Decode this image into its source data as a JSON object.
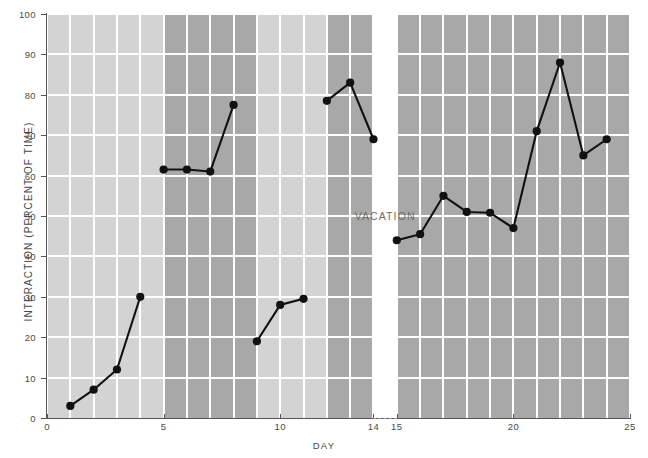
{
  "chart_data": {
    "type": "line",
    "title": "",
    "xlabel": "DAY",
    "ylabel": "INTERACTION (PERCENT OF TIME)",
    "xlim": [
      0,
      25
    ],
    "ylim": [
      0,
      100
    ],
    "grid": true,
    "legend": null,
    "y_ticks": [
      0,
      10,
      20,
      30,
      40,
      50,
      60,
      70,
      80,
      90,
      100
    ],
    "x_ticks": [
      0,
      5,
      10,
      14,
      15,
      20,
      25
    ],
    "x_tick_labels": [
      "0",
      "5",
      "10",
      "14",
      "15",
      "20",
      "25"
    ],
    "annotations": [
      {
        "text": "VACATION",
        "x": 14.5,
        "y": 50
      }
    ],
    "series": [
      {
        "name": "Interaction",
        "marker": "filled-circle",
        "color": "#111111",
        "segments": [
          {
            "x": [
              1,
              2,
              3,
              4
            ],
            "y": [
              3,
              7,
              12,
              30
            ]
          },
          {
            "x": [
              5,
              6,
              7,
              8
            ],
            "y": [
              61.5,
              61.5,
              61,
              77.5
            ]
          },
          {
            "x": [
              9,
              10,
              11
            ],
            "y": [
              19,
              28,
              29.5
            ]
          },
          {
            "x": [
              12,
              13,
              14
            ],
            "y": [
              78.5,
              83,
              69
            ]
          },
          {
            "x": [
              15,
              16,
              17,
              18,
              19,
              20,
              21,
              22,
              23,
              24
            ],
            "y": [
              44,
              45.5,
              55,
              51,
              50.8,
              47,
              71,
              88,
              65,
              69
            ]
          }
        ]
      }
    ],
    "background_bands": [
      {
        "from": 0,
        "to": 5,
        "shade": "light"
      },
      {
        "from": 5,
        "to": 9,
        "shade": "dark"
      },
      {
        "from": 9,
        "to": 12,
        "shade": "light"
      },
      {
        "from": 12,
        "to": 14,
        "shade": "dark"
      },
      {
        "from": 14,
        "to": 15,
        "shade": "none"
      },
      {
        "from": 15,
        "to": 25,
        "shade": "dark"
      }
    ],
    "colors": {
      "band_light": "#d3d3d3",
      "band_dark": "#a8a8a8",
      "gridline": "#ffffff",
      "line": "#111111",
      "axis": "#555555",
      "text": "#4a4a4a"
    }
  }
}
